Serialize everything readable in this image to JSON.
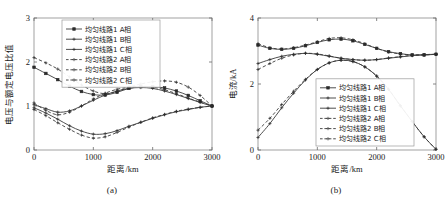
{
  "figure": {
    "panels": [
      {
        "caption": "(a)",
        "xlabel": "距离/km",
        "ylabel": "电压与额定电压比值",
        "xticks": [
          "0",
          "1000",
          "2000",
          "3000"
        ],
        "yticks": [
          "0",
          "1",
          "2",
          "3"
        ]
      },
      {
        "caption": "(b)",
        "xlabel": "距离/km",
        "ylabel": "电流/kA",
        "xticks": [
          "0",
          "1000",
          "2000",
          "3000"
        ],
        "yticks": [
          "0",
          "2",
          "4"
        ]
      }
    ],
    "legend": [
      {
        "label": "均匀线路1 A相",
        "style": "solid",
        "marker": "square"
      },
      {
        "label": "均匀线路1 B相",
        "style": "solid",
        "marker": "plus"
      },
      {
        "label": "均匀线路1 C相",
        "style": "solid",
        "marker": "plus"
      },
      {
        "label": "均匀线路2 A相",
        "style": "dashed",
        "marker": "plus"
      },
      {
        "label": "均匀线路2 B相",
        "style": "dashed",
        "marker": "plus"
      },
      {
        "label": "均匀线路2 C相",
        "style": "dashed",
        "marker": "plus"
      }
    ],
    "colors": {
      "curve": "#3a3a3a",
      "axis": "#8a8a8a",
      "text": "#1a1a1a",
      "background": "#ffffff"
    }
  },
  "chart_data": [
    {
      "type": "line",
      "title": "(a)",
      "xlabel": "距离/km",
      "ylabel": "电压与额定电压比值",
      "xlim": [
        0,
        3000
      ],
      "ylim": [
        0,
        3
      ],
      "xticks": [
        0,
        1000,
        2000,
        3000
      ],
      "yticks": [
        0,
        1,
        2,
        3
      ],
      "grid": false,
      "legend_position": "upper-center",
      "x": [
        0,
        200,
        400,
        600,
        800,
        1000,
        1200,
        1400,
        1600,
        1800,
        2000,
        2200,
        2400,
        2600,
        2800,
        3000
      ],
      "series": [
        {
          "name": "均匀线路1 A相",
          "style": "solid",
          "marker": "square",
          "values": [
            1.88,
            1.74,
            1.6,
            1.45,
            1.33,
            1.26,
            1.25,
            1.31,
            1.4,
            1.44,
            1.44,
            1.41,
            1.34,
            1.24,
            1.12,
            1.0
          ]
        },
        {
          "name": "均匀线路1 B相",
          "style": "solid",
          "marker": "plus",
          "values": [
            1.03,
            0.94,
            0.86,
            0.89,
            1.0,
            1.13,
            1.25,
            1.34,
            1.4,
            1.42,
            1.4,
            1.34,
            1.26,
            1.17,
            1.08,
            1.0
          ]
        },
        {
          "name": "均匀线路1 C相",
          "style": "solid",
          "marker": "plus",
          "values": [
            0.96,
            0.84,
            0.7,
            0.55,
            0.43,
            0.36,
            0.37,
            0.44,
            0.54,
            0.63,
            0.72,
            0.8,
            0.87,
            0.92,
            0.97,
            1.0
          ]
        },
        {
          "name": "均匀线路2 A相",
          "style": "dashed",
          "marker": "plus",
          "values": [
            2.1,
            1.98,
            1.84,
            1.66,
            1.48,
            1.34,
            1.28,
            1.33,
            1.43,
            1.5,
            1.55,
            1.57,
            1.54,
            1.43,
            1.24,
            1.0
          ]
        },
        {
          "name": "均匀线路2 B相",
          "style": "dashed",
          "marker": "plus",
          "values": [
            1.07,
            0.9,
            0.8,
            0.86,
            1.0,
            1.16,
            1.29,
            1.38,
            1.43,
            1.45,
            1.43,
            1.37,
            1.28,
            1.18,
            1.09,
            1.0
          ]
        },
        {
          "name": "均匀线路2 C相",
          "style": "dashed",
          "marker": "plus",
          "values": [
            0.92,
            0.78,
            0.62,
            0.47,
            0.34,
            0.27,
            0.3,
            0.4,
            0.52,
            0.63,
            0.73,
            0.81,
            0.88,
            0.93,
            0.97,
            1.0
          ]
        }
      ]
    },
    {
      "type": "line",
      "title": "(b)",
      "xlabel": "距离/km",
      "ylabel": "电流/kA",
      "xlim": [
        0,
        3000
      ],
      "ylim": [
        0,
        4
      ],
      "xticks": [
        0,
        1000,
        2000,
        3000
      ],
      "yticks": [
        0,
        2,
        4
      ],
      "grid": false,
      "legend_position": "lower-center",
      "x": [
        0,
        200,
        400,
        600,
        800,
        1000,
        1200,
        1400,
        1600,
        1800,
        2000,
        2200,
        2400,
        2600,
        2800,
        3000
      ],
      "series": [
        {
          "name": "均匀线路1 A相",
          "style": "solid",
          "marker": "square",
          "values": [
            3.18,
            3.08,
            3.05,
            3.08,
            3.16,
            3.26,
            3.34,
            3.36,
            3.31,
            3.2,
            3.08,
            2.98,
            2.92,
            2.88,
            2.88,
            2.9
          ]
        },
        {
          "name": "均匀线路1 B相",
          "style": "solid",
          "marker": "plus",
          "values": [
            2.62,
            2.74,
            2.84,
            2.9,
            2.93,
            2.9,
            2.84,
            2.78,
            2.74,
            2.72,
            2.74,
            2.78,
            2.82,
            2.86,
            2.89,
            2.9
          ]
        },
        {
          "name": "均匀线路1 C相",
          "style": "solid",
          "marker": "plus",
          "values": [
            0.38,
            0.8,
            1.28,
            1.72,
            2.12,
            2.44,
            2.64,
            2.72,
            2.68,
            2.52,
            2.24,
            1.84,
            1.34,
            0.86,
            0.4,
            0.02
          ]
        },
        {
          "name": "均匀线路2 A相",
          "style": "dashed",
          "marker": "plus",
          "values": [
            3.22,
            3.1,
            3.06,
            3.1,
            3.18,
            3.28,
            3.38,
            3.4,
            3.34,
            3.22,
            3.08,
            2.97,
            2.91,
            2.88,
            2.88,
            2.9
          ]
        },
        {
          "name": "均匀线路2 B相",
          "style": "dashed",
          "marker": "plus",
          "values": [
            2.44,
            2.62,
            2.78,
            2.88,
            2.93,
            2.91,
            2.85,
            2.78,
            2.74,
            2.72,
            2.74,
            2.79,
            2.83,
            2.87,
            2.89,
            2.9
          ]
        },
        {
          "name": "均匀线路2 C相",
          "style": "dashed",
          "marker": "plus",
          "values": [
            0.6,
            0.96,
            1.38,
            1.78,
            2.14,
            2.44,
            2.64,
            2.72,
            2.68,
            2.52,
            2.24,
            1.84,
            1.34,
            0.86,
            0.4,
            0.02
          ]
        }
      ]
    }
  ]
}
